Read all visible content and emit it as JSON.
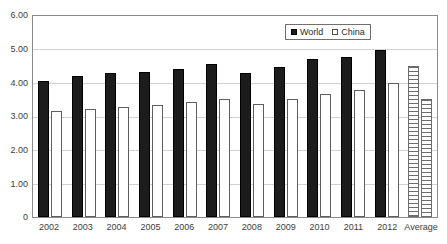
{
  "chart_data": {
    "type": "bar",
    "title": "",
    "subtitle": "",
    "xlabel": "",
    "ylabel": "",
    "ylim": [
      0,
      6
    ],
    "ytick_labels": [
      "6.00",
      "5.00",
      "4.00",
      "3.00",
      "2.00",
      "1.00",
      "0"
    ],
    "ytick_values": [
      6,
      5,
      4,
      3,
      2,
      1,
      0
    ],
    "grid": true,
    "legend_position": "top-right",
    "categories": [
      "2002",
      "2003",
      "2004",
      "2005",
      "2006",
      "2007",
      "2008",
      "2009",
      "2010",
      "2011",
      "2012",
      "Average"
    ],
    "series": [
      {
        "name": "World",
        "values": [
          4.05,
          4.21,
          4.31,
          4.34,
          4.42,
          4.58,
          4.31,
          4.48,
          4.73,
          4.79,
          4.98,
          4.5
        ]
      },
      {
        "name": "China",
        "values": [
          3.17,
          3.21,
          3.29,
          3.35,
          3.42,
          3.52,
          3.38,
          3.52,
          3.67,
          3.79,
          4.0,
          3.52
        ]
      }
    ],
    "legend": [
      {
        "label": "World",
        "swatch": "filled-black-square"
      },
      {
        "label": "China",
        "swatch": "hollow-white-square"
      }
    ],
    "colors": {
      "world_bar": "#1c1c1c",
      "china_bar": "#ffffff",
      "china_bar_border": "#5e5e5e",
      "average_hatch": "#6b6b6b",
      "gridline": "#d2d2d2",
      "axis": "#8a8a8a",
      "text": "#3d3d3d"
    }
  }
}
